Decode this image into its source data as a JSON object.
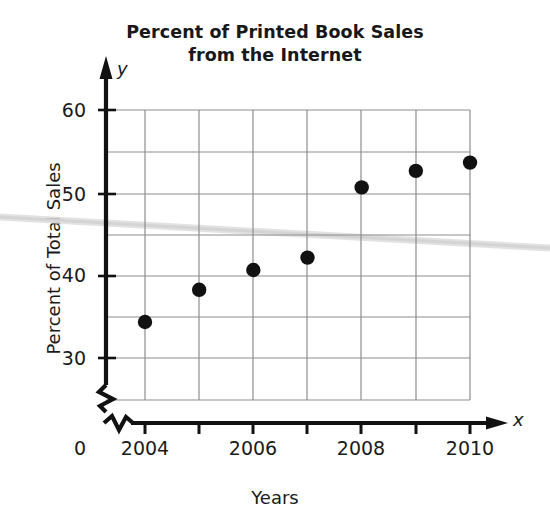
{
  "chart_data": {
    "type": "scatter",
    "title": "Percent of Printed Book Sales from the Internet",
    "title_lines": [
      "Percent of Printed Book Sales",
      "from the Internet"
    ],
    "xlabel": "Years",
    "ylabel": "Percent of Total Sales",
    "x_axis_letter": "x",
    "y_axis_letter": "y",
    "origin_label": "0",
    "xlim": [
      2003.5,
      2010.5
    ],
    "ylim": [
      28,
      62
    ],
    "x_ticks": [
      2004,
      2005,
      2006,
      2007,
      2008,
      2009,
      2010
    ],
    "x_tick_labels": [
      "2004",
      "",
      "2006",
      "",
      "2008",
      "",
      "2010"
    ],
    "x_tick_labels_shown": [
      "2004",
      "2006",
      "2008",
      "2010"
    ],
    "y_ticks": [
      30,
      40,
      50,
      60
    ],
    "y_tick_labels": [
      "30",
      "40",
      "50",
      "60"
    ],
    "y_gridlines": [
      30,
      35,
      40,
      45,
      50,
      55,
      60
    ],
    "x_gridlines": [
      2004,
      2005,
      2006,
      2007,
      2008,
      2009,
      2010
    ],
    "grid": true,
    "axis_break_x": true,
    "axis_break_y": true,
    "legend": null,
    "marker": "filled-circle",
    "marker_color": "#111111",
    "grid_color": "#9a9a9a",
    "axis_color": "#111111",
    "background_color": "#ffffff",
    "x": [
      2004,
      2005,
      2006,
      2007,
      2008,
      2009,
      2010
    ],
    "values": [
      34.5,
      38.4,
      40.8,
      42.3,
      50.8,
      52.8,
      53.8
    ],
    "points": [
      {
        "year": "2004",
        "percent": 34.5
      },
      {
        "year": "2005",
        "percent": 38.4
      },
      {
        "year": "2006",
        "percent": 40.8
      },
      {
        "year": "2007",
        "percent": 42.3
      },
      {
        "year": "2008",
        "percent": 50.8
      },
      {
        "year": "2009",
        "percent": 52.8
      },
      {
        "year": "2010",
        "percent": 53.8
      }
    ]
  }
}
